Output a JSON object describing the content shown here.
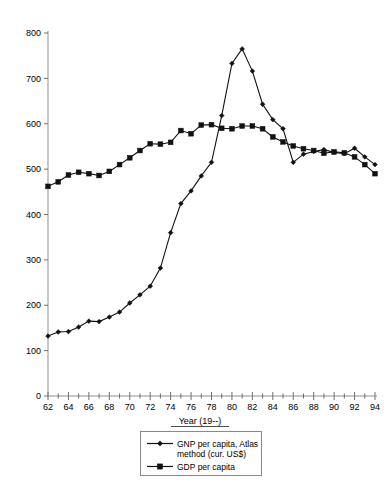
{
  "chart_data": {
    "type": "line",
    "title": "",
    "xlabel": "Year (19--)",
    "ylabel": "",
    "xlim": [
      62,
      94
    ],
    "ylim": [
      0,
      800
    ],
    "ytick_step": 100,
    "xtick_step": 2,
    "x_minor_tick_step": 1,
    "grid": false,
    "legend_position": "bottom-center",
    "x": [
      62,
      63,
      64,
      65,
      66,
      67,
      68,
      69,
      70,
      71,
      72,
      73,
      74,
      75,
      76,
      77,
      78,
      79,
      80,
      81,
      82,
      83,
      84,
      85,
      86,
      87,
      88,
      89,
      90,
      91,
      92,
      93,
      94
    ],
    "xtick_labels": [
      "62",
      "64",
      "66",
      "68",
      "70",
      "72",
      "74",
      "76",
      "78",
      "80",
      "82",
      "84",
      "86",
      "88",
      "90",
      "92",
      "94"
    ],
    "ytick_labels": [
      "0",
      "100",
      "200",
      "300",
      "400",
      "500",
      "600",
      "700",
      "800"
    ],
    "series": [
      {
        "name": "GNP per capita, Atlas method (cur. US$)",
        "marker": "diamond",
        "color": "#111111",
        "values": [
          132,
          141,
          142,
          152,
          165,
          164,
          174,
          185,
          205,
          223,
          242,
          282,
          360,
          424,
          452,
          485,
          515,
          618,
          733,
          765,
          716,
          643,
          609,
          589,
          515,
          533,
          539,
          543,
          537,
          534,
          546,
          527,
          510
        ]
      },
      {
        "name": "GDP per capita",
        "marker": "square",
        "color": "#111111",
        "values": [
          462,
          472,
          487,
          493,
          490,
          486,
          495,
          510,
          525,
          541,
          556,
          555,
          559,
          585,
          578,
          597,
          598,
          590,
          589,
          595,
          595,
          589,
          571,
          560,
          551,
          545,
          541,
          535,
          538,
          536,
          527,
          510,
          490
        ]
      }
    ]
  },
  "legend": {
    "entries": [
      {
        "label_line1": "GNP per capita, Atlas",
        "label_line2": "method (cur. US$)",
        "marker": "diamond"
      },
      {
        "label_line1": "GDP per capita",
        "label_line2": "",
        "marker": "square"
      }
    ]
  },
  "axes": {
    "x_axis_title": "Year (19--)"
  },
  "colors": {
    "series": "#111111",
    "axis": "#8e8e8e",
    "background": "#ffffff",
    "legend_border": "#8a8a8a"
  }
}
